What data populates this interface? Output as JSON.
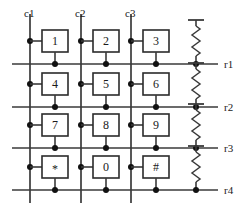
{
  "diagram": {
    "background_color": "#ffffff",
    "line_color": "#3a3a3a",
    "box_fill": "#ffffff",
    "box_stroke": "#2b2b2b",
    "dot_color": "#111111",
    "text_color": "#1a1a1a"
  },
  "columns": [
    {
      "id": "c1",
      "label": "c1",
      "x": 30,
      "label_x": 24,
      "label_y": 8
    },
    {
      "id": "c2",
      "label": "c2",
      "x": 81,
      "label_x": 75,
      "label_y": 8
    },
    {
      "id": "c3",
      "label": "c3",
      "x": 131,
      "label_x": 125,
      "label_y": 8
    }
  ],
  "rows": [
    {
      "id": "r1",
      "label": "r1",
      "y": 64,
      "label_x": 224,
      "label_y": 59
    },
    {
      "id": "r2",
      "label": "r2",
      "y": 107,
      "label_x": 224,
      "label_y": 102
    },
    {
      "id": "r3",
      "label": "r3",
      "y": 148,
      "label_x": 224,
      "label_y": 143
    },
    {
      "id": "r4",
      "label": "r4",
      "y": 190,
      "label_x": 224,
      "label_y": 185
    }
  ],
  "geometry": {
    "col_line_top": 14,
    "col_line_bottom": 203,
    "row_line_left": 12,
    "row_line_right": 218,
    "box_width": 26,
    "box_height": 22,
    "switch_node_dy": -23,
    "resistor_x": 196,
    "resistor_top_offset": -44,
    "resistor_bar_half_width": 8,
    "resistor_zig_count": 5
  },
  "keys": [
    {
      "label": "1",
      "column": "c1",
      "row": "r1",
      "cx": 55,
      "cy": 41,
      "symbol": false
    },
    {
      "label": "2",
      "column": "c2",
      "row": "r1",
      "cx": 106,
      "cy": 41,
      "symbol": false
    },
    {
      "label": "3",
      "column": "c3",
      "row": "r1",
      "cx": 156,
      "cy": 41,
      "symbol": false
    },
    {
      "label": "4",
      "column": "c1",
      "row": "r2",
      "cx": 55,
      "cy": 84,
      "symbol": false
    },
    {
      "label": "5",
      "column": "c2",
      "row": "r2",
      "cx": 106,
      "cy": 84,
      "symbol": false
    },
    {
      "label": "6",
      "column": "c3",
      "row": "r2",
      "cx": 156,
      "cy": 84,
      "symbol": false
    },
    {
      "label": "7",
      "column": "c1",
      "row": "r3",
      "cx": 55,
      "cy": 125,
      "symbol": false
    },
    {
      "label": "8",
      "column": "c2",
      "row": "r3",
      "cx": 106,
      "cy": 125,
      "symbol": false
    },
    {
      "label": "9",
      "column": "c3",
      "row": "r3",
      "cx": 156,
      "cy": 125,
      "symbol": false
    },
    {
      "label": "*",
      "column": "c1",
      "row": "r4",
      "cx": 55,
      "cy": 167,
      "symbol": true
    },
    {
      "label": "0",
      "column": "c2",
      "row": "r4",
      "cx": 106,
      "cy": 167,
      "symbol": false
    },
    {
      "label": "#",
      "column": "c3",
      "row": "r4",
      "cx": 156,
      "cy": 167,
      "symbol": true
    }
  ],
  "resistors": [
    {
      "row": "r1",
      "name": "pullup-r1"
    },
    {
      "row": "r2",
      "name": "pullup-r2"
    },
    {
      "row": "r3",
      "name": "pullup-r3"
    },
    {
      "row": "r4",
      "name": "pullup-r4"
    }
  ]
}
